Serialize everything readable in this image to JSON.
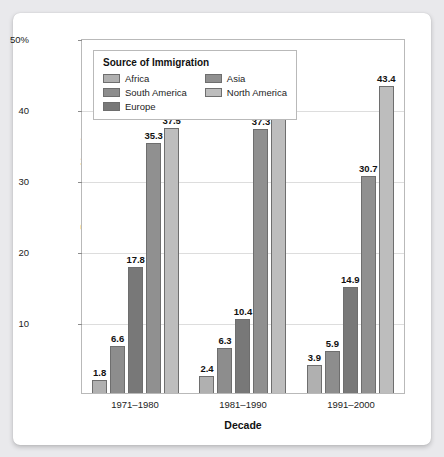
{
  "chart_data": {
    "type": "bar",
    "title": "",
    "xlabel": "Decade",
    "ylabel": "Percentage of immigrants",
    "categories": [
      "1971–1980",
      "1981–1990",
      "1991–2000"
    ],
    "ylim": [
      0,
      50
    ],
    "yticks": [
      10,
      20,
      30,
      40,
      50
    ],
    "ytick_labels": [
      "10",
      "20",
      "30",
      "40",
      "50%"
    ],
    "grid": true,
    "legend_position": "upper-left-inside",
    "legend_title": "Source of Immigration",
    "series": [
      {
        "name": "Africa",
        "color": "#b0b0b0",
        "values": [
          1.8,
          2.4,
          3.9
        ]
      },
      {
        "name": "South America",
        "color": "#8d8d8d",
        "values": [
          6.6,
          6.3,
          5.9
        ]
      },
      {
        "name": "Europe",
        "color": "#787878",
        "values": [
          17.8,
          10.4,
          14.9
        ]
      },
      {
        "name": "Asia",
        "color": "#909090",
        "values": [
          35.3,
          37.3,
          30.7
        ]
      },
      {
        "name": "North America",
        "color": "#bdbdbd",
        "values": [
          37.5,
          43.0,
          43.4
        ]
      }
    ],
    "data_labels": [
      [
        "1.8",
        "6.6",
        "17.8",
        "35.3",
        "37.5"
      ],
      [
        "2.4",
        "6.3",
        "10.4",
        "37.3",
        "43.0"
      ],
      [
        "3.9",
        "5.9",
        "14.9",
        "30.7",
        "43.4"
      ]
    ]
  },
  "legend": {
    "title": "Source of Immigration",
    "items": [
      {
        "label": "Africa"
      },
      {
        "label": "Asia"
      },
      {
        "label": "South America"
      },
      {
        "label": "North America"
      },
      {
        "label": "Europe"
      }
    ]
  }
}
